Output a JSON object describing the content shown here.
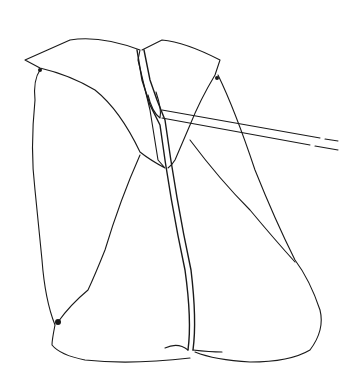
{
  "figure": {
    "colors": {
      "line": "#1a1a1a",
      "background": "#ffffff"
    }
  }
}
